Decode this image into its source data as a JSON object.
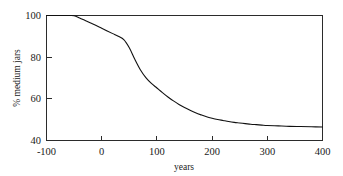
{
  "chart_data": {
    "type": "line",
    "title": "",
    "xlabel": "years",
    "ylabel": "% medium jars",
    "xlim": [
      -100,
      400
    ],
    "ylim": [
      40,
      100
    ],
    "grid": false,
    "legend": null,
    "x_ticks": [
      "-100",
      "0",
      "100",
      "200",
      "300",
      "400"
    ],
    "x_tick_values": [
      -100,
      0,
      100,
      200,
      300,
      400
    ],
    "y_ticks": [
      "40",
      "60",
      "80",
      "100"
    ],
    "y_tick_values": [
      40,
      60,
      80,
      100
    ],
    "series": [
      {
        "name": "% medium jars",
        "x": [
          -100,
          -80,
          -60,
          -50,
          -40,
          -30,
          -20,
          -10,
          0,
          10,
          20,
          30,
          40,
          50,
          60,
          70,
          80,
          90,
          100,
          110,
          120,
          130,
          140,
          150,
          160,
          170,
          180,
          190,
          200,
          210,
          220,
          230,
          240,
          250,
          260,
          270,
          280,
          290,
          300,
          320,
          340,
          360,
          380,
          400
        ],
        "y": [
          100,
          100,
          100,
          99.9,
          98.8,
          97.6,
          96.4,
          95.2,
          93.9,
          92.6,
          91.3,
          90.0,
          88.4,
          84.5,
          79.0,
          74.0,
          70.2,
          67.4,
          65.2,
          63.0,
          60.9,
          59.0,
          57.3,
          55.8,
          54.5,
          53.3,
          52.3,
          51.4,
          50.7,
          50.1,
          49.6,
          49.1,
          48.7,
          48.4,
          48.1,
          47.8,
          47.6,
          47.4,
          47.2,
          47.0,
          46.8,
          46.7,
          46.6,
          46.5
        ]
      }
    ],
    "annotations": [],
    "colors": {
      "curve": "#111111",
      "axis": "#2b2b2b",
      "background": "#ffffff",
      "text": "#1a1a1a"
    }
  }
}
